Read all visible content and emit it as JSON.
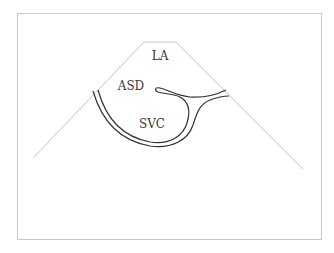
{
  "figure": {
    "labels": {
      "la": "LA",
      "asd": "ASD",
      "svc": "SVC"
    },
    "colors": {
      "frame": "#c8c8c8",
      "sector": "#c4c4c4",
      "structure": "#333333",
      "label": "#3a3a3a",
      "background": "#ffffff"
    }
  }
}
